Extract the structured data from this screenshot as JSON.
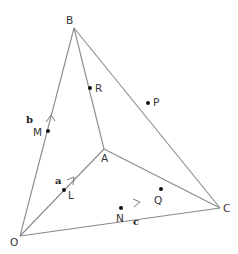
{
  "diagram": {
    "type": "vector-geometry",
    "points": {
      "O": {
        "label": "O",
        "x": 20,
        "y": 236
      },
      "A": {
        "label": "A",
        "x": 104,
        "y": 149
      },
      "B": {
        "label": "B",
        "x": 74,
        "y": 28
      },
      "C": {
        "label": "C",
        "x": 220,
        "y": 208
      }
    },
    "edge_points": [
      {
        "label": "R",
        "on": "AB",
        "x": 90,
        "y": 88
      },
      {
        "label": "P",
        "on": "BC",
        "x": 148,
        "y": 103
      },
      {
        "label": "Q",
        "on": "AC",
        "x": 161,
        "y": 189
      },
      {
        "label": "L",
        "on": "OA",
        "x": 64,
        "y": 190
      },
      {
        "label": "M",
        "on": "OB",
        "x": 48,
        "y": 131
      },
      {
        "label": "N",
        "on": "OC",
        "x": 121,
        "y": 208
      }
    ],
    "edges": [
      "OA",
      "OB",
      "OC",
      "AB",
      "AC",
      "BC"
    ],
    "vectors": [
      {
        "label": "a",
        "along": "OA"
      },
      {
        "label": "b",
        "along": "OB"
      },
      {
        "label": "c",
        "along": "OC"
      }
    ],
    "labels": {
      "O": "O",
      "A": "A",
      "B": "B",
      "C": "C",
      "R": "R",
      "P": "P",
      "Q": "Q",
      "L": "L",
      "M": "M",
      "N": "N",
      "a": "a",
      "b": "b",
      "c": "c"
    },
    "colors": {
      "line": "#8a8a8a",
      "point": "#111111",
      "text": "#333333"
    }
  }
}
